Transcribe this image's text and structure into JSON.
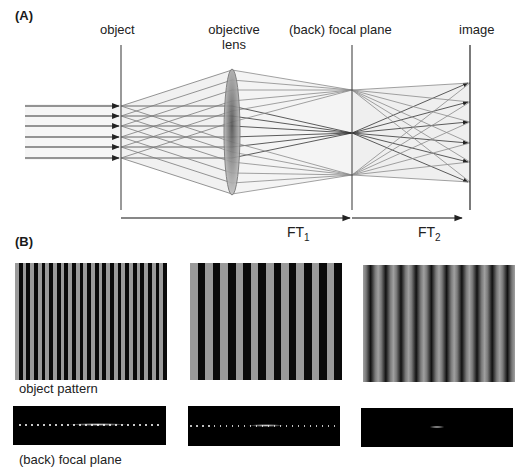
{
  "panel_a": {
    "label": "(A)",
    "labels": {
      "object": "object",
      "objective_lens_line1": "objective",
      "objective_lens_line2": "lens",
      "focal_plane": "(back) focal plane",
      "image": "image"
    },
    "transforms": {
      "ft1_main": "FT",
      "ft1_sub": "1",
      "ft2_main": "FT",
      "ft2_sub": "2"
    },
    "input_ray_count": 6,
    "focal_points": [
      "top",
      "center",
      "bottom"
    ]
  },
  "panel_b": {
    "label": "(B)",
    "row_labels": {
      "object_pattern": "object pattern",
      "focal_plane": "(back) focal plane"
    },
    "patterns": [
      {
        "name": "fine-grating",
        "stripes": 20,
        "profile": "square"
      },
      {
        "name": "coarse-grating",
        "stripes": 10,
        "profile": "square"
      },
      {
        "name": "sinusoidal-grating",
        "stripes": 10,
        "profile": "sinusoidal"
      }
    ],
    "spectra": [
      {
        "name": "fine-grating-spectrum",
        "description": "many diffraction spots along a line"
      },
      {
        "name": "coarse-grating-spectrum",
        "description": "dense row of diffraction spots"
      },
      {
        "name": "sinusoidal-grating-spectrum",
        "description": "central spot with two close side orders"
      }
    ]
  },
  "colors": {
    "background": "#ffffff",
    "ray_dark": "#3a3a3a",
    "ray_light": "#8a8a8a",
    "cone_fill": "#ececec",
    "stripe_dark": "#0a0a0a",
    "stripe_light": "#9a9a9a",
    "spectrum_bg": "#000000"
  }
}
